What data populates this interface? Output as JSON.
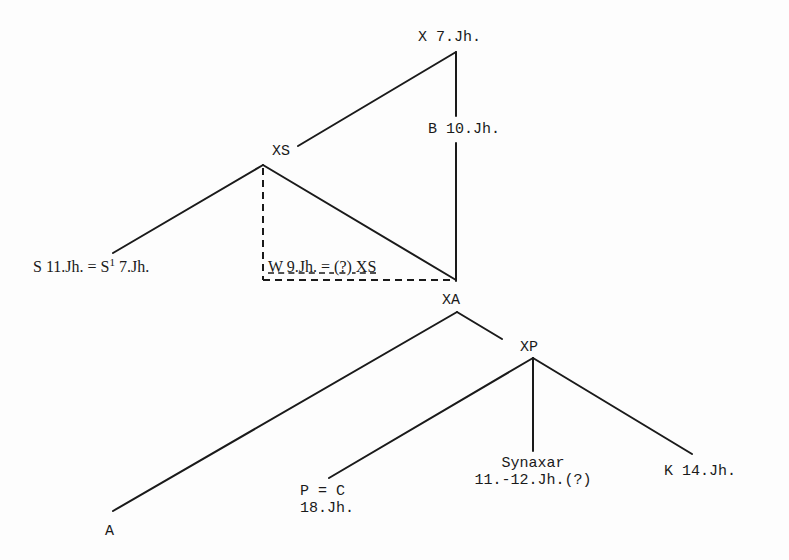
{
  "diagram": {
    "type": "stemma",
    "nodes": {
      "x": {
        "label": "X 7.Jh."
      },
      "b": {
        "label": "B 10.Jh."
      },
      "xs": {
        "label": "XS"
      },
      "s": {
        "label_pre": "S 11.Jh. = S",
        "sup": "1",
        "label_post": " 7.Jh."
      },
      "w": {
        "label": "W 9.Jh. = (?) XS"
      },
      "xa": {
        "label": "XA"
      },
      "xp": {
        "label": "XP"
      },
      "a": {
        "label": "A"
      },
      "p": {
        "line1": "P = C",
        "line2": "18.Jh."
      },
      "synaxar": {
        "line1": "Synaxar",
        "line2": "11.-12.Jh.(?)"
      },
      "k": {
        "label": "K 14.Jh."
      }
    },
    "edges": [
      {
        "from": "x",
        "to": "xs",
        "style": "solid"
      },
      {
        "from": "x",
        "to": "b",
        "style": "solid"
      },
      {
        "from": "xs",
        "to": "s",
        "style": "solid"
      },
      {
        "from": "xs",
        "to": "xa-junction",
        "style": "solid"
      },
      {
        "from": "b",
        "to": "xa-junction",
        "style": "solid"
      },
      {
        "from": "xs",
        "to": "w",
        "style": "dashed"
      },
      {
        "from": "xa",
        "to": "a",
        "style": "solid"
      },
      {
        "from": "xa",
        "to": "xp",
        "style": "solid"
      },
      {
        "from": "xp",
        "to": "p",
        "style": "solid"
      },
      {
        "from": "xp",
        "to": "synaxar",
        "style": "solid"
      },
      {
        "from": "xp",
        "to": "k",
        "style": "solid"
      }
    ],
    "colors": {
      "ink": "#1a1a1a",
      "paper": "#fdfdfd"
    }
  }
}
